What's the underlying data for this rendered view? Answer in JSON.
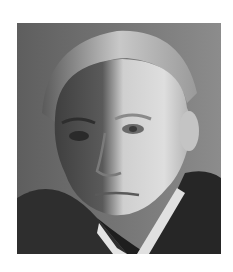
{
  "image": {
    "type": "photograph",
    "style": "black-and-white portrait",
    "subject": "elderly man with swept-back grey hair, dark jacket and white collar",
    "alt": "Black-and-white portrait of a man"
  },
  "colors": {
    "background": "#ffffff",
    "photo_background": "#6e6e6e",
    "skin_light": "#d8d8d8",
    "skin_shadow": "#4a4a4a",
    "hair": "#b5b5b5",
    "jacket": "#2a2a2a",
    "collar": "#e6e6e6"
  }
}
